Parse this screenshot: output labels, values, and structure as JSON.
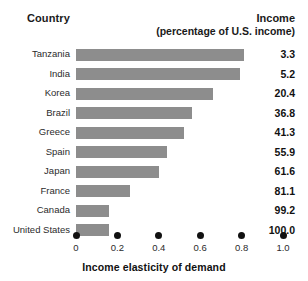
{
  "header": {
    "country_label": "Country",
    "income_label": "Income",
    "income_sublabel": "(percentage of U.S. income)"
  },
  "axis": {
    "title": "Income elasticity of demand",
    "ticks": [
      "0",
      "0.2",
      "0.4",
      "0.6",
      "0.8",
      "1.0"
    ],
    "min": 0,
    "max": 1.0
  },
  "style": {
    "bar_color": "#8d8d8d",
    "text_color": "#1a1a1a",
    "background": "#ffffff"
  },
  "chart_data": {
    "type": "bar",
    "orientation": "horizontal",
    "title": "",
    "xlabel": "Income elasticity of demand",
    "ylabel": "Country",
    "xlim": [
      0,
      1.0
    ],
    "grid": false,
    "legend": "none",
    "categories": [
      "Tanzania",
      "India",
      "Korea",
      "Brazil",
      "Greece",
      "Spain",
      "Japan",
      "France",
      "Canada",
      "United States"
    ],
    "values": [
      0.81,
      0.79,
      0.66,
      0.56,
      0.52,
      0.44,
      0.4,
      0.26,
      0.16,
      0.16
    ],
    "annotations": {
      "column_header": "Income (percentage of U.S. income)",
      "labels": [
        "3.3",
        "5.2",
        "20.4",
        "36.8",
        "41.3",
        "55.9",
        "61.6",
        "81.1",
        "99.2",
        "100.0"
      ]
    },
    "rows": [
      {
        "country": "Tanzania",
        "elasticity": 0.81,
        "income_pct": "3.3"
      },
      {
        "country": "India",
        "elasticity": 0.79,
        "income_pct": "5.2"
      },
      {
        "country": "Korea",
        "elasticity": 0.66,
        "income_pct": "20.4"
      },
      {
        "country": "Brazil",
        "elasticity": 0.56,
        "income_pct": "36.8"
      },
      {
        "country": "Greece",
        "elasticity": 0.52,
        "income_pct": "41.3"
      },
      {
        "country": "Spain",
        "elasticity": 0.44,
        "income_pct": "55.9"
      },
      {
        "country": "Japan",
        "elasticity": 0.4,
        "income_pct": "61.6"
      },
      {
        "country": "France",
        "elasticity": 0.26,
        "income_pct": "81.1"
      },
      {
        "country": "Canada",
        "elasticity": 0.16,
        "income_pct": "99.2"
      },
      {
        "country": "United States",
        "elasticity": 0.16,
        "income_pct": "100.0"
      }
    ]
  }
}
